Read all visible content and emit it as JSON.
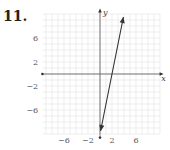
{
  "problem": {
    "number": "11."
  },
  "chart_data": {
    "type": "line",
    "title": "",
    "xlabel": "x",
    "ylabel": "y",
    "xlim": [
      -10,
      10
    ],
    "ylim": [
      -10,
      10
    ],
    "grid": true,
    "x_ticks": [
      -6,
      -2,
      2,
      6
    ],
    "y_ticks": [
      6,
      2,
      -2,
      -6
    ],
    "x_tick_labels": [
      "−6",
      "−2",
      "2",
      "6"
    ],
    "y_tick_labels": [
      "6",
      "2",
      "−2",
      "−6"
    ],
    "series": [
      {
        "name": "line",
        "equation": "y = 5x - 10",
        "points": [
          [
            0.1,
            -9.5
          ],
          [
            3.9,
            9.5
          ]
        ],
        "x_intercept": 2,
        "arrows": "both",
        "color": "#333333"
      }
    ]
  }
}
